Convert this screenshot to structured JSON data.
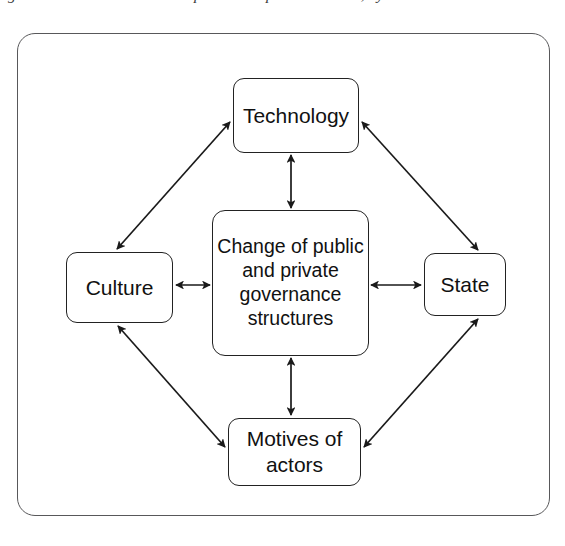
{
  "caption": {
    "text": "governance structures in the public and private sectors, by",
    "note": "clipped at top edge of scan"
  },
  "diagram": {
    "frame": {
      "name": "outer-frame",
      "border_color": "#58585a",
      "background": "#ffffff"
    },
    "nodes": [
      {
        "id": "technology",
        "label": "Technology",
        "position": "top"
      },
      {
        "id": "culture",
        "label": "Culture",
        "position": "left"
      },
      {
        "id": "center",
        "label": "Change of public\nand private\ngovernance\nstructures",
        "position": "center"
      },
      {
        "id": "state",
        "label": "State",
        "position": "right"
      },
      {
        "id": "motives",
        "label": "Motives of\nactors",
        "position": "bottom"
      }
    ],
    "connections": [
      {
        "id": "center-technology",
        "from": "center",
        "to": "technology",
        "style": "double-arrow",
        "orientation": "vertical"
      },
      {
        "id": "center-culture",
        "from": "center",
        "to": "culture",
        "style": "double-arrow",
        "orientation": "horizontal"
      },
      {
        "id": "center-state",
        "from": "center",
        "to": "state",
        "style": "double-arrow",
        "orientation": "horizontal"
      },
      {
        "id": "center-motives",
        "from": "center",
        "to": "motives",
        "style": "double-arrow",
        "orientation": "vertical"
      },
      {
        "id": "culture-technology",
        "from": "culture",
        "to": "technology",
        "style": "double-arrow",
        "orientation": "diagonal"
      },
      {
        "id": "technology-state",
        "from": "technology",
        "to": "state",
        "style": "double-arrow",
        "orientation": "diagonal"
      },
      {
        "id": "state-motives",
        "from": "state",
        "to": "motives",
        "style": "double-arrow",
        "orientation": "diagonal"
      },
      {
        "id": "motives-culture",
        "from": "motives",
        "to": "culture",
        "style": "double-arrow",
        "orientation": "diagonal"
      }
    ],
    "colors": {
      "node_border": "#222222",
      "node_fill": "#ffffff",
      "arrow": "#1a1a1a",
      "frame_border": "#58585a"
    }
  }
}
